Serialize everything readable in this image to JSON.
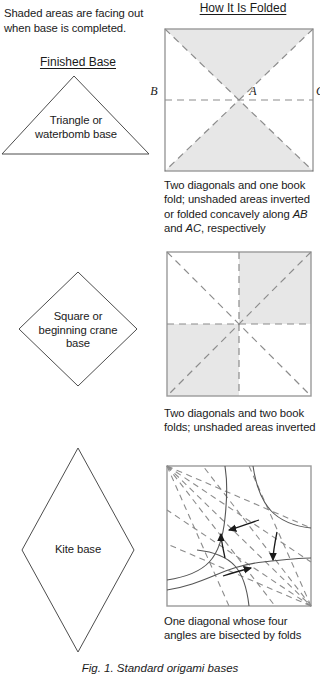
{
  "figure": {
    "intro_note": "Shaded areas are facing out when base is completed.",
    "caption": "Fig. 1. Standard origami bases",
    "columns": {
      "finished_base": "Finished Base",
      "how_it_is_folded": "How It Is Folded"
    },
    "colors": {
      "shaded_fill": "#e7e7e7",
      "fold_line": "#8c8c8c",
      "outline": "#4d4d4d",
      "arrow": "#1a1a1a",
      "text": "#1a1a1a"
    }
  },
  "rows": [
    {
      "id": "triangle-waterbomb",
      "base_shape": "triangle",
      "base_label_line1": "Triangle or",
      "base_label_line2": "waterbomb base",
      "base_label": "Triangle or waterbomb base",
      "vertex_labels": [
        "B",
        "A",
        "C"
      ],
      "caption": "Two diagonals and one book fold; unshaded areas inverted or folded concavely along AB and AC, respectively",
      "caption_parts": {
        "p1": "Two diagonals and one book fold; unshaded areas inverted or folded concavely along ",
        "em1": "AB",
        "p2": " and ",
        "em2": "AC",
        "p3": ", respectively"
      },
      "fold_summary": "Two diagonals and one book fold",
      "shaded_regions": [
        "top-triangle",
        "bottom-triangle"
      ]
    },
    {
      "id": "square-crane",
      "base_shape": "diamond",
      "base_label_line1": "Square or",
      "base_label_line2": "beginning crane",
      "base_label_line3": "base",
      "base_label": "Square or beginning crane base",
      "vertex_labels": [],
      "caption": "Two diagonals and two book folds; unshaded areas inverted",
      "caption_parts": {
        "p1": "Two diagonals and two book folds; unshaded areas inverted",
        "em1": "",
        "p2": "",
        "em2": "",
        "p3": ""
      },
      "fold_summary": "Two diagonals and two book folds",
      "shaded_regions": [
        "top-right-quadrant",
        "bottom-left-quadrant"
      ]
    },
    {
      "id": "kite",
      "base_shape": "rhombus",
      "base_label_line1": "Kite base",
      "base_label_line2": "",
      "base_label_line3": "",
      "base_label": "Kite base",
      "vertex_labels": [],
      "caption": "One diagonal whose four angles are bisected by folds",
      "caption_parts": {
        "p1": "One diagonal whose four angles are bisected by folds",
        "em1": "",
        "p2": "",
        "em2": "",
        "p3": ""
      },
      "fold_summary": "One diagonal whose four angles are bisected by folds",
      "shaded_regions": []
    }
  ]
}
